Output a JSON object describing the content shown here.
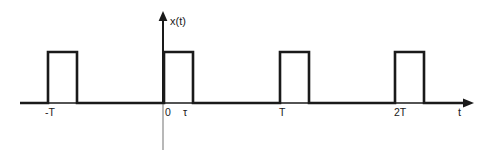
{
  "figure": {
    "background_color": "#ffffff",
    "line_color": "#1a1a1a",
    "axis_below_color": "#9a9a9a",
    "width": 498,
    "height": 155
  },
  "axes": {
    "y_axis": {
      "label": "x(t)",
      "label_x": 170,
      "label_y": 16,
      "x_pos": 163,
      "top_y": 13,
      "bottom_y": 150,
      "arrow": "up-arrow-icon"
    },
    "x_axis": {
      "label": "t",
      "label_x": 458,
      "label_y": 107,
      "y_pos": 103,
      "start_x": 20,
      "end_x": 473,
      "arrow": "right-arrow-icon"
    }
  },
  "tick_labels": [
    {
      "text": "-T",
      "x": 45,
      "y": 107
    },
    {
      "text": "0",
      "x": 165,
      "y": 107
    },
    {
      "text": "τ",
      "x": 183,
      "y": 107
    },
    {
      "text": "T",
      "x": 279,
      "y": 107
    },
    {
      "text": "2T",
      "x": 394,
      "y": 107
    }
  ],
  "chart_data": {
    "type": "line",
    "title": "",
    "subtitle": "",
    "xlabel": "t",
    "ylabel": "x(t)",
    "grid": false,
    "legend": false,
    "legend_position": "none",
    "waveform": "rectangular-pulse-train",
    "amplitude": 1,
    "baseline": 0,
    "period_label": "T",
    "pulse_width_label": "τ",
    "period_px": 116,
    "pulse_width_px": 29,
    "duty_cycle": 0.25,
    "x_tick_values": [
      "-T",
      "0",
      "τ",
      "T",
      "2T"
    ],
    "x_tick_px": [
      48,
      164,
      193,
      280,
      395
    ],
    "y_values_px": {
      "zero_level": 103,
      "high_level": 52
    },
    "xlim_px": [
      20,
      473
    ],
    "pulses": [
      {
        "name": "pulse-minus-T",
        "start_px": 48,
        "end_px": 77,
        "start_label": "-T",
        "end_label": "-T+τ",
        "amplitude": 1
      },
      {
        "name": "pulse-zero",
        "start_px": 164,
        "end_px": 193,
        "start_label": "0",
        "end_label": "τ",
        "amplitude": 1
      },
      {
        "name": "pulse-T",
        "start_px": 280,
        "end_px": 309,
        "start_label": "T",
        "end_label": "T+τ",
        "amplitude": 1
      },
      {
        "name": "pulse-2T",
        "start_px": 395,
        "end_px": 424,
        "start_label": "2T",
        "end_label": "2T+τ",
        "amplitude": 1
      }
    ],
    "points": [
      [
        20,
        0
      ],
      [
        48,
        0
      ],
      [
        48,
        1
      ],
      [
        77,
        1
      ],
      [
        77,
        0
      ],
      [
        164,
        0
      ],
      [
        164,
        1
      ],
      [
        193,
        1
      ],
      [
        193,
        0
      ],
      [
        280,
        0
      ],
      [
        280,
        1
      ],
      [
        309,
        1
      ],
      [
        309,
        0
      ],
      [
        395,
        0
      ],
      [
        395,
        1
      ],
      [
        424,
        1
      ],
      [
        424,
        0
      ],
      [
        466,
        0
      ]
    ]
  }
}
